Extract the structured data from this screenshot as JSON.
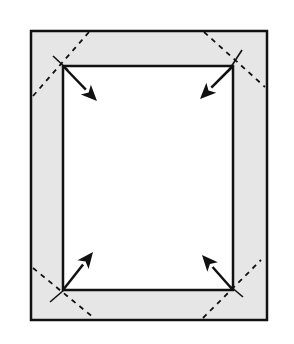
{
  "diagram": {
    "colors": {
      "background": "#ffffff",
      "frame_fill": "#e6e6e6",
      "stroke": "#111111"
    },
    "outer_rect": {
      "x": 31,
      "y": 31,
      "w": 236,
      "h": 289
    },
    "inner_rect": {
      "x": 63,
      "y": 66,
      "w": 170,
      "h": 224
    },
    "corners": [
      {
        "name": "top-left",
        "mitre": [
          [
            33,
            96
          ],
          [
            89,
            32
          ]
        ],
        "cut": [
          [
            53,
            56
          ],
          [
            68,
            70
          ]
        ],
        "arrow": {
          "from": [
            64,
            67
          ],
          "to": [
            97,
            101
          ]
        }
      },
      {
        "name": "top-right",
        "mitre": [
          [
            204,
            32
          ],
          [
            265,
            87
          ]
        ],
        "cut": [
          [
            242,
            50
          ],
          [
            229,
            70
          ]
        ],
        "arrow": {
          "from": [
            232,
            67
          ],
          "to": [
            200,
            99
          ]
        }
      },
      {
        "name": "bottom-left",
        "mitre": [
          [
            33,
            268
          ],
          [
            94,
            318
          ]
        ],
        "cut": [
          [
            50,
            302
          ],
          [
            64,
            290
          ]
        ],
        "arrow": {
          "from": [
            63,
            290
          ],
          "to": [
            93,
            252
          ]
        }
      },
      {
        "name": "bottom-right",
        "mitre": [
          [
            203,
            318
          ],
          [
            261,
            260
          ]
        ],
        "cut": [
          [
            243,
            297
          ],
          [
            230,
            286
          ]
        ],
        "arrow": {
          "from": [
            232,
            289
          ],
          "to": [
            202,
            255
          ]
        }
      }
    ]
  }
}
